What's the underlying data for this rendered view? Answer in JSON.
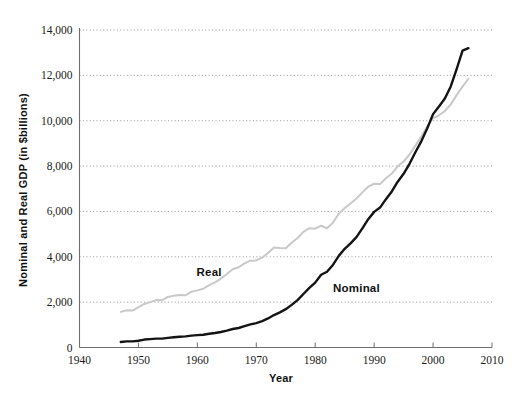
{
  "chart_data": {
    "type": "line",
    "title": "",
    "xlabel": "Year",
    "ylabel": "Nominal and Real GDP (in $billions)",
    "xlim": [
      1940,
      2010
    ],
    "ylim": [
      0,
      14000
    ],
    "xticks": [
      "1940",
      "1950",
      "1960",
      "1970",
      "1980",
      "1990",
      "2000",
      "2010"
    ],
    "yticks": [
      "0",
      "2,000",
      "4,000",
      "6,000",
      "8,000",
      "10,000",
      "12,000",
      "14,000"
    ],
    "grid": "horizontal-dotted",
    "legend": "inline-labels",
    "annotations": [
      {
        "text": "Real",
        "x": 1962,
        "y": 3150
      },
      {
        "text": "Nominal",
        "x": 1987,
        "y": 2450
      }
    ],
    "series": [
      {
        "name": "Real",
        "color": "#c9c9c9",
        "x": [
          1947,
          1948,
          1949,
          1950,
          1951,
          1952,
          1953,
          1954,
          1955,
          1956,
          1957,
          1958,
          1959,
          1960,
          1961,
          1962,
          1963,
          1964,
          1965,
          1966,
          1967,
          1968,
          1969,
          1970,
          1971,
          1972,
          1973,
          1974,
          1975,
          1976,
          1977,
          1978,
          1979,
          1980,
          1981,
          1982,
          1983,
          1984,
          1985,
          1986,
          1987,
          1988,
          1989,
          1990,
          1991,
          1992,
          1993,
          1994,
          1995,
          1996,
          1997,
          1998,
          1999,
          2000,
          2001,
          2002,
          2003,
          2004,
          2005,
          2006
        ],
        "values": [
          1570,
          1640,
          1630,
          1780,
          1920,
          2000,
          2090,
          2080,
          2230,
          2280,
          2320,
          2300,
          2460,
          2520,
          2590,
          2750,
          2870,
          3040,
          3240,
          3450,
          3540,
          3710,
          3830,
          3840,
          3960,
          4170,
          4410,
          4390,
          4380,
          4620,
          4830,
          5100,
          5260,
          5240,
          5370,
          5260,
          5500,
          5900,
          6150,
          6350,
          6570,
          6840,
          7090,
          7220,
          7210,
          7460,
          7670,
          7990,
          8200,
          8510,
          8900,
          9300,
          9750,
          10110,
          10240,
          10420,
          10720,
          11130,
          11500,
          11850
        ]
      },
      {
        "name": "Nominal",
        "color": "#141414",
        "x": [
          1947,
          1948,
          1949,
          1950,
          1951,
          1952,
          1953,
          1954,
          1955,
          1956,
          1957,
          1958,
          1959,
          1960,
          1961,
          1962,
          1963,
          1964,
          1965,
          1966,
          1967,
          1968,
          1969,
          1970,
          1971,
          1972,
          1973,
          1974,
          1975,
          1976,
          1977,
          1978,
          1979,
          1980,
          1981,
          1982,
          1983,
          1984,
          1985,
          1986,
          1987,
          1988,
          1989,
          1990,
          1991,
          1992,
          1993,
          1994,
          1995,
          1996,
          1997,
          1998,
          1999,
          2000,
          2001,
          2002,
          2003,
          2004,
          2005,
          2006
        ],
        "values": [
          245,
          270,
          270,
          300,
          350,
          370,
          390,
          390,
          425,
          450,
          475,
          490,
          525,
          545,
          565,
          605,
          640,
          685,
          745,
          815,
          860,
          940,
          1020,
          1075,
          1165,
          1280,
          1430,
          1550,
          1690,
          1880,
          2090,
          2360,
          2630,
          2860,
          3210,
          3340,
          3640,
          4040,
          4350,
          4590,
          4870,
          5250,
          5660,
          5980,
          6170,
          6540,
          6880,
          7310,
          7660,
          8100,
          8610,
          9090,
          9660,
          10290,
          10630,
          10980,
          11510,
          12270,
          13090,
          13200
        ]
      }
    ]
  }
}
